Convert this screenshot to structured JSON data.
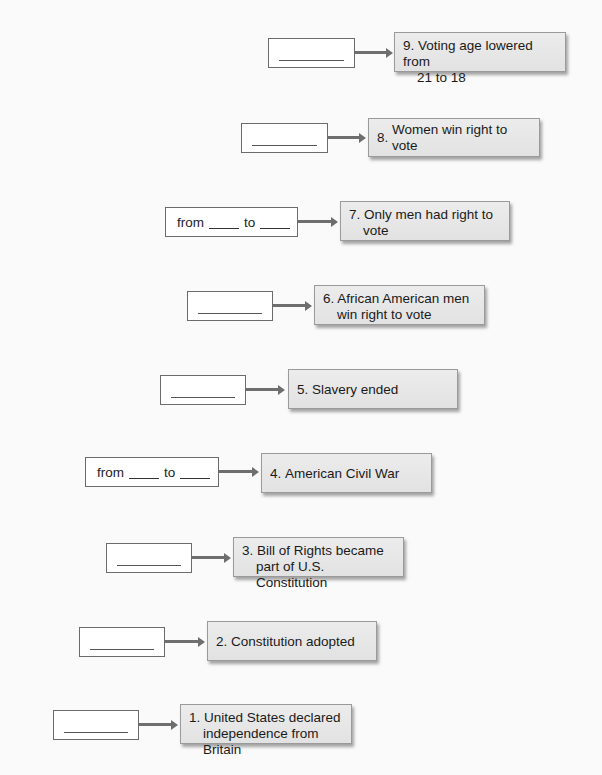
{
  "events": [
    {
      "number": "9.",
      "line1": "Voting age lowered from",
      "line2": "21 to 18",
      "answer_type": "blank",
      "range_from": "from",
      "range_to": "to"
    },
    {
      "number": "8.",
      "line1": "Women win right to vote",
      "line2": "",
      "answer_type": "blank",
      "range_from": "from",
      "range_to": "to"
    },
    {
      "number": "7.",
      "line1": "Only men had right to",
      "line2": "vote",
      "answer_type": "range",
      "range_from": "from",
      "range_to": "to"
    },
    {
      "number": "6.",
      "line1": "African American men",
      "line2": "win right to vote",
      "answer_type": "blank",
      "range_from": "from",
      "range_to": "to"
    },
    {
      "number": "5.",
      "line1": "Slavery ended",
      "line2": "",
      "answer_type": "blank",
      "range_from": "from",
      "range_to": "to"
    },
    {
      "number": "4.",
      "line1": "American Civil War",
      "line2": "",
      "answer_type": "range",
      "range_from": "from",
      "range_to": "to"
    },
    {
      "number": "3.",
      "line1": "Bill of Rights became",
      "line2": "part of U.S. Constitution",
      "answer_type": "blank",
      "range_from": "from",
      "range_to": "to"
    },
    {
      "number": "2.",
      "line1": "Constitution adopted",
      "line2": "",
      "answer_type": "blank",
      "range_from": "from",
      "range_to": "to"
    },
    {
      "number": "1.",
      "line1": "United States declared",
      "line2": "independence from Britain",
      "answer_type": "blank",
      "range_from": "from",
      "range_to": "to"
    }
  ]
}
